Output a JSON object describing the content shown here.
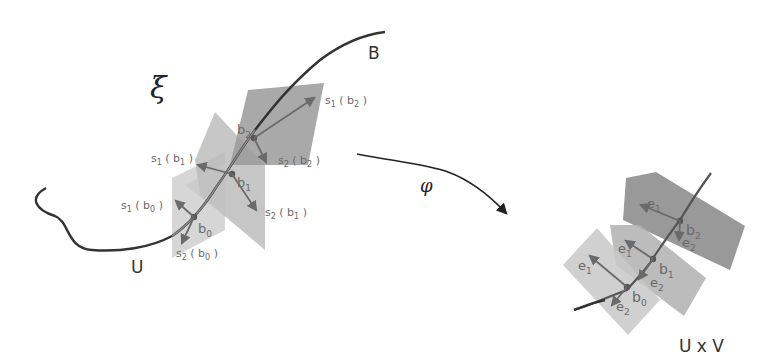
{
  "diagram": {
    "left_panel": {
      "bundle_label": "ξ",
      "base_label": "B",
      "open_set_label": "U",
      "points": [
        "b0",
        "b1",
        "b2"
      ],
      "sections": [
        {
          "point": "b0",
          "s1_label": "s1(b0)",
          "s2_label": "s2(b0)"
        },
        {
          "point": "b1",
          "s1_label": "s1(b1)",
          "s2_label": "s2(b1)"
        },
        {
          "point": "b2",
          "s1_label": "s1(b2)",
          "s2_label": "s2(b2)"
        }
      ]
    },
    "map_label": "φ",
    "right_panel": {
      "product_label": "U x V",
      "frames": [
        {
          "point": "b0",
          "e1": "e1",
          "e2": "e2"
        },
        {
          "point": "b1",
          "e1": "e1",
          "e2": "e2"
        },
        {
          "point": "b2",
          "e1": "e1",
          "e2": "e2"
        }
      ]
    },
    "colors": {
      "curve": "#333333",
      "plane_light": "#c8c8c8",
      "plane_mid": "#aaaaaa",
      "plane_dark": "#8e8e8e",
      "arrow": "#6a6a6a",
      "point": "#555555"
    }
  }
}
